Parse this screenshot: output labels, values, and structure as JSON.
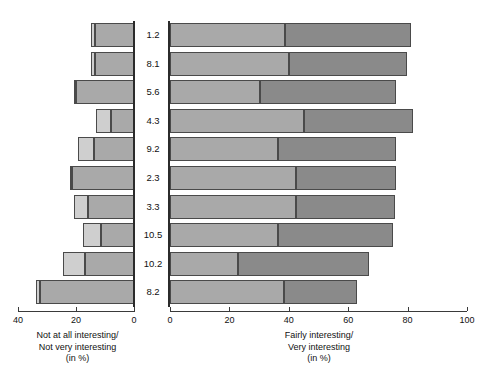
{
  "chart_data": {
    "type": "bar",
    "subtype": "back-to-back stacked horizontal bar (tornado)",
    "title": "",
    "grid": false,
    "legend_position": "none",
    "categories": [
      "1.2",
      "8.1",
      "5.6",
      "4.3",
      "9.2",
      "2.3",
      "3.3",
      "10.5",
      "10.2",
      "8.2"
    ],
    "center_column": {
      "label": "",
      "values": [
        "1.2",
        "8.1",
        "5.6",
        "4.3",
        "9.2",
        "2.3",
        "3.3",
        "10.5",
        "10.2",
        "8.2"
      ]
    },
    "left_panel": {
      "xlabel_lines": [
        "Not at all interesting/",
        "Not very interesting",
        "(in %)"
      ],
      "xlim": [
        40,
        0
      ],
      "reversed": true,
      "ticks": [
        40,
        20,
        0
      ],
      "tick_labels": [
        "40",
        "20",
        "0"
      ],
      "series": [
        {
          "name": "Not at all interesting",
          "values": [
            1.3,
            1.5,
            0.8,
            5.2,
            5.4,
            0.9,
            4.8,
            6.2,
            7.6,
            1.4
          ]
        },
        {
          "name": "Not very interesting",
          "values": [
            13.5,
            13.3,
            20.0,
            8.0,
            13.9,
            21.3,
            15.8,
            11.4,
            17.0,
            32.4
          ]
        }
      ],
      "totals": [
        14.8,
        14.8,
        20.8,
        13.2,
        19.3,
        22.2,
        20.6,
        17.6,
        24.6,
        33.8
      ]
    },
    "right_panel": {
      "xlabel_lines": [
        "Fairly interesting/",
        "Very interesting",
        "(in %)"
      ],
      "xlim": [
        0,
        100
      ],
      "ticks": [
        0,
        20,
        40,
        60,
        80,
        100
      ],
      "tick_labels": [
        "0",
        "20",
        "40",
        "60",
        "80",
        "100"
      ],
      "series": [
        {
          "name": "Fairly interesting",
          "values": [
            38.8,
            40.2,
            30.3,
            45.2,
            36.4,
            42.3,
            42.5,
            36.3,
            22.8,
            38.4
          ]
        },
        {
          "name": "Very interesting",
          "values": [
            42.2,
            39.6,
            45.9,
            36.6,
            39.7,
            33.7,
            33.1,
            38.8,
            44.2,
            24.5
          ]
        }
      ],
      "totals": [
        81.0,
        79.8,
        76.2,
        81.8,
        76.1,
        76.0,
        75.6,
        75.1,
        67.0,
        62.9
      ]
    },
    "colors": {
      "not_at_all": "#cfcfcf",
      "not_very": "#a9a9a9",
      "fairly": "#a9a9a9",
      "very": "#8a8a8a",
      "outline": "#4a4a4a",
      "axis": "#3a3a3a",
      "text": "#111111"
    }
  }
}
